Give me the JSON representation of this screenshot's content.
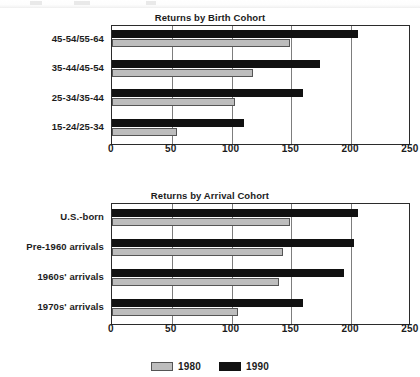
{
  "legend": {
    "entries": [
      {
        "label": "1980",
        "color": "#bdbdbd",
        "swatch": "legend-swatch-1980"
      },
      {
        "label": "1990",
        "color": "#111111",
        "swatch": "legend-swatch-1990"
      }
    ]
  },
  "chart_data": [
    {
      "type": "bar",
      "orientation": "horizontal",
      "title": "Returns by Birth Cohort",
      "xlabel": "",
      "ylabel": "",
      "xlim": [
        0,
        250
      ],
      "ticks": [
        "0",
        "50",
        "100",
        "150",
        "200",
        "250"
      ],
      "tick_values": [
        0,
        50,
        100,
        150,
        200,
        250
      ],
      "grid": true,
      "legend_position": "bottom-shared",
      "categories": [
        "45-54/55-64",
        "35-44/45-54",
        "25-34/35-44",
        "15-24/25-34"
      ],
      "series": [
        {
          "name": "1980",
          "color": "#bdbdbd",
          "values": [
            149,
            118,
            103,
            54
          ]
        },
        {
          "name": "1990",
          "color": "#111111",
          "values": [
            206,
            174,
            160,
            110
          ]
        }
      ]
    },
    {
      "type": "bar",
      "orientation": "horizontal",
      "title": "Returns by Arrival Cohort",
      "xlabel": "",
      "ylabel": "",
      "xlim": [
        0,
        250
      ],
      "ticks": [
        "0",
        "50",
        "100",
        "150",
        "200",
        "250"
      ],
      "tick_values": [
        0,
        50,
        100,
        150,
        200,
        250
      ],
      "grid": true,
      "legend_position": "bottom-shared",
      "categories": [
        "U.S.-born",
        "Pre-1960 arrivals",
        "1960s' arrivals",
        "1970s' arrivals"
      ],
      "series": [
        {
          "name": "1980",
          "color": "#bdbdbd",
          "values": [
            149,
            143,
            140,
            105
          ]
        },
        {
          "name": "1990",
          "color": "#111111",
          "values": [
            206,
            202,
            194,
            160
          ]
        }
      ]
    }
  ]
}
